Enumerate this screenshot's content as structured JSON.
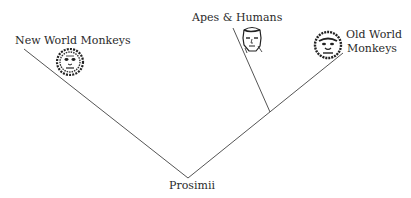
{
  "diagram": {
    "type": "phylogenetic-tree",
    "root": {
      "label": "Prosimii"
    },
    "leaves": [
      {
        "label": "New World Monkeys",
        "icon": "new-world-monkey-face-icon"
      },
      {
        "label": "Apes & Humans",
        "icon": "human-face-icon"
      },
      {
        "label_line1": "Old World",
        "label_line2": "Monkeys",
        "icon": "old-world-monkey-face-icon"
      }
    ],
    "line_color": "#555555"
  }
}
